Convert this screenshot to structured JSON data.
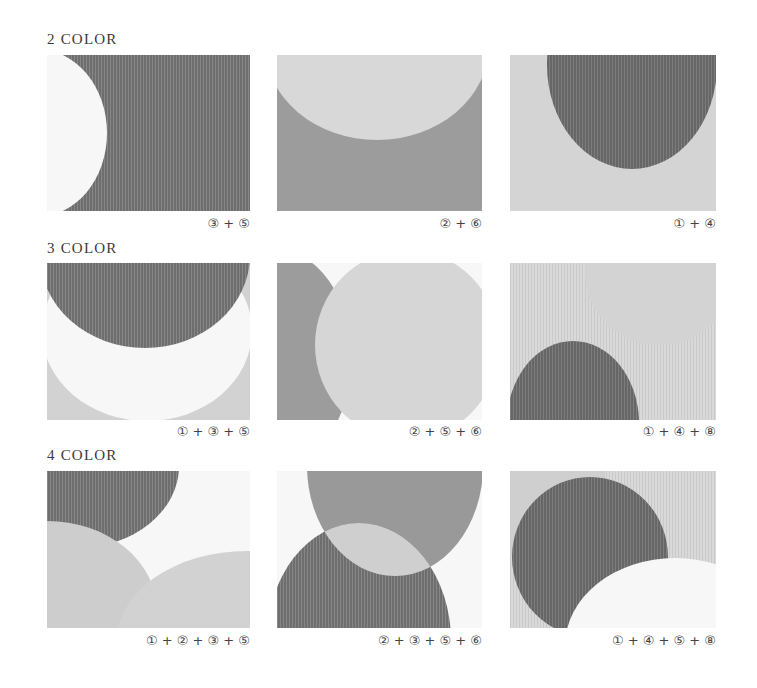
{
  "colors": {
    "1": "#cfcfcf",
    "2": "#bdbdbd",
    "3": "#7a7a7a",
    "4": "#6c6c6c",
    "5": "#f7f7f7",
    "6": "#9a9a9a",
    "8": "#dadada"
  },
  "sections": [
    {
      "title": "2 COLOR",
      "panels": [
        {
          "caption": "③ + ⑤"
        },
        {
          "caption": "② + ⑥"
        },
        {
          "caption": "① + ④"
        }
      ]
    },
    {
      "title": "3 COLOR",
      "panels": [
        {
          "caption": "① + ③ + ⑤"
        },
        {
          "caption": "② + ⑤ + ⑥"
        },
        {
          "caption": "① + ④ + ⑧"
        }
      ]
    },
    {
      "title": "4 COLOR",
      "panels": [
        {
          "caption": "① + ② + ③ + ⑤"
        },
        {
          "caption": "② + ③ + ⑤ + ⑥"
        },
        {
          "caption": "① + ④ + ⑤ + ⑧"
        }
      ]
    }
  ]
}
